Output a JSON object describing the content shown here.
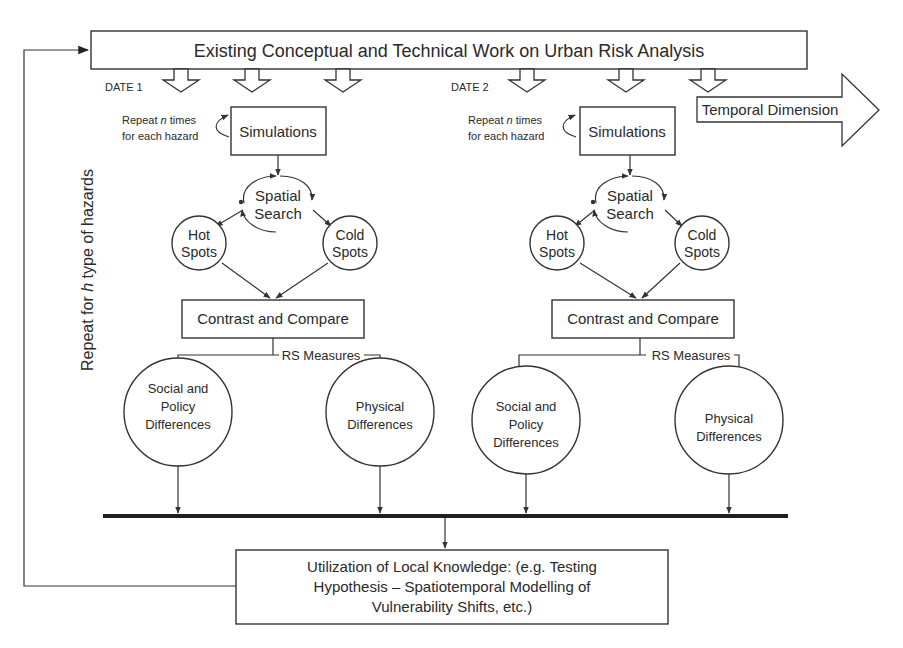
{
  "diagram": {
    "top_box": {
      "label": "Existing Conceptual and Technical Work on Urban Risk Analysis"
    },
    "side_label": {
      "prefix": "Repeat for ",
      "var": "h",
      "suffix": " type of hazards"
    },
    "temporal_arrow": {
      "label": "Temporal Dimension"
    },
    "bottom_box": {
      "lines": [
        "Utilization of Local Knowledge: (e.g. Testing",
        "Hypothesis – Spatiotemporal Modelling of",
        "Vulnerability Shifts, etc.)"
      ]
    },
    "panels": [
      {
        "date_label": "DATE 1",
        "repeat_note": {
          "line1_prefix": "Repeat ",
          "line1_var": "n",
          "line1_suffix": " times",
          "line2": "for each hazard"
        },
        "simulations": "Simulations",
        "spatial_search": [
          "Spatial",
          "Search"
        ],
        "hot_spots": [
          "Hot",
          "Spots"
        ],
        "cold_spots": [
          "Cold",
          "Spots"
        ],
        "contrast": "Contrast and Compare",
        "rs_measures": "RS Measures",
        "social": [
          "Social and",
          "Policy",
          "Differences"
        ],
        "physical": [
          "Physical",
          "Differences"
        ]
      },
      {
        "date_label": "DATE 2",
        "repeat_note": {
          "line1_prefix": "Repeat ",
          "line1_var": "n",
          "line1_suffix": " times",
          "line2": "for each hazard"
        },
        "simulations": "Simulations",
        "spatial_search": [
          "Spatial",
          "Search"
        ],
        "hot_spots": [
          "Hot",
          "Spots"
        ],
        "cold_spots": [
          "Cold",
          "Spots"
        ],
        "contrast": "Contrast and Compare",
        "rs_measures": "RS Measures",
        "social": [
          "Social and",
          "Policy",
          "Differences"
        ],
        "physical": [
          "Physical",
          "Differences"
        ]
      }
    ]
  }
}
